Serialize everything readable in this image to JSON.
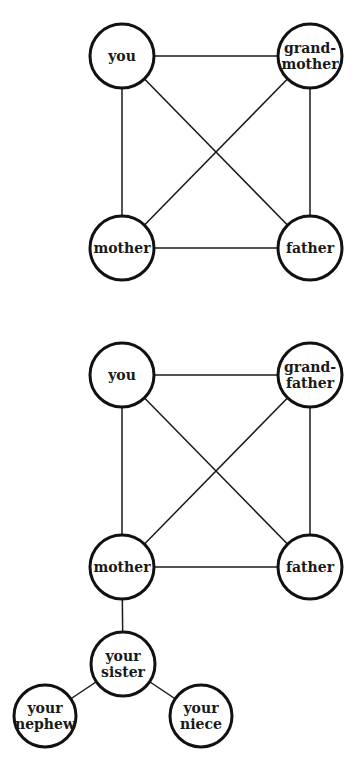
{
  "diagrams": [
    {
      "name": "family-graph-grandmother",
      "nodes": [
        {
          "id": "you",
          "lines": [
            "you"
          ],
          "cx": 122,
          "cy": 56,
          "r": 32
        },
        {
          "id": "grandmother",
          "lines": [
            "grand-",
            "mother"
          ],
          "cx": 310,
          "cy": 56,
          "r": 32
        },
        {
          "id": "mother",
          "lines": [
            "mother"
          ],
          "cx": 122,
          "cy": 248,
          "r": 32
        },
        {
          "id": "father",
          "lines": [
            "father"
          ],
          "cx": 310,
          "cy": 248,
          "r": 32
        }
      ],
      "edges": [
        [
          "you",
          "grandmother"
        ],
        [
          "you",
          "mother"
        ],
        [
          "you",
          "father"
        ],
        [
          "grandmother",
          "mother"
        ],
        [
          "grandmother",
          "father"
        ],
        [
          "mother",
          "father"
        ]
      ]
    },
    {
      "name": "family-graph-grandfather",
      "nodes": [
        {
          "id": "you",
          "lines": [
            "you"
          ],
          "cx": 122,
          "cy": 375,
          "r": 32
        },
        {
          "id": "grandfather",
          "lines": [
            "grand-",
            "father"
          ],
          "cx": 310,
          "cy": 375,
          "r": 32
        },
        {
          "id": "mother",
          "lines": [
            "mother"
          ],
          "cx": 122,
          "cy": 567,
          "r": 32
        },
        {
          "id": "father",
          "lines": [
            "father"
          ],
          "cx": 310,
          "cy": 567,
          "r": 32
        },
        {
          "id": "sister",
          "lines": [
            "your",
            "sister"
          ],
          "cx": 123,
          "cy": 664,
          "r": 32
        },
        {
          "id": "nephew",
          "lines": [
            "your",
            "nephew"
          ],
          "cx": 45,
          "cy": 716,
          "r": 31
        },
        {
          "id": "niece",
          "lines": [
            "your",
            "niece"
          ],
          "cx": 201,
          "cy": 716,
          "r": 31
        }
      ],
      "edges": [
        [
          "you",
          "grandfather"
        ],
        [
          "you",
          "mother"
        ],
        [
          "you",
          "father"
        ],
        [
          "grandfather",
          "mother"
        ],
        [
          "grandfather",
          "father"
        ],
        [
          "mother",
          "father"
        ],
        [
          "mother",
          "sister"
        ],
        [
          "sister",
          "nephew"
        ],
        [
          "sister",
          "niece"
        ]
      ]
    }
  ],
  "labels": {
    "d1_you": "you",
    "d1_grandmother_1": "grand-",
    "d1_grandmother_2": "mother",
    "d1_mother": "mother",
    "d1_father": "father",
    "d2_you": "you",
    "d2_grandfather_1": "grand-",
    "d2_grandfather_2": "father",
    "d2_mother": "mother",
    "d2_father": "father",
    "d2_sister_1": "your",
    "d2_sister_2": "sister",
    "d2_nephew_1": "your",
    "d2_nephew_2": "nephew",
    "d2_niece_1": "your",
    "d2_niece_2": "niece"
  }
}
